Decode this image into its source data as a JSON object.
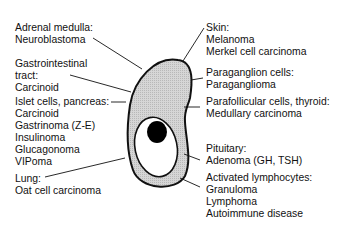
{
  "cell": {
    "cytoplasm_color": "#cfcfcf",
    "outline_color": "#111111",
    "nucleus_color": "#ffffff",
    "nucleolus_color": "#000000"
  },
  "left_labels": [
    {
      "lines": [
        "Adrenal medulla:",
        "Neuroblastoma"
      ]
    },
    {
      "lines": [
        "Gastrointestinal",
        "tract:",
        "Carcinoid"
      ]
    },
    {
      "lines": [
        "Islet cells, pancreas:",
        "Carcinoid",
        "Gastrinoma (Z-E)",
        "Insulinoma",
        "Glucagonoma",
        "VIPoma"
      ]
    },
    {
      "lines": [
        "Lung:",
        "Oat cell carcinoma"
      ]
    }
  ],
  "right_labels": [
    {
      "lines": [
        "Skin:",
        "Melanoma",
        "Merkel cell carcinoma"
      ]
    },
    {
      "lines": [
        "Paraganglion cells:",
        "Paraganglioma"
      ]
    },
    {
      "lines": [
        "Parafollicular cells, thyroid:",
        "Medullary carcinoma"
      ]
    },
    {
      "lines": [
        "Pituitary:",
        "Adenoma (GH, TSH)"
      ]
    },
    {
      "lines": [
        "Activated lymphocytes:",
        "Granuloma",
        "Lymphoma",
        "Autoimmune disease"
      ]
    }
  ]
}
